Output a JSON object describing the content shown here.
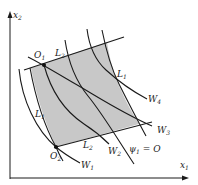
{
  "diagram": {
    "axes": {
      "x_label": "x",
      "x_sub": "1",
      "y_label": "x",
      "y_sub": "2"
    },
    "region_fill": "#c8c8c8",
    "line_color": "#1a1a1a",
    "points": [
      {
        "name": "O",
        "sub": "1"
      },
      {
        "name": "O",
        "sub": "2"
      }
    ],
    "constraints": {
      "L2_top": {
        "label": "L",
        "sub": "2"
      },
      "L2_bottom": {
        "label": "L",
        "sub": "2"
      },
      "L1_left": {
        "label": "L",
        "sub": "1"
      },
      "L1_right": {
        "label": "L",
        "sub": "1"
      }
    },
    "curves": [
      {
        "label": "W",
        "sub": "1"
      },
      {
        "label": "W",
        "sub": "2"
      },
      {
        "label": "W",
        "sub": "3"
      },
      {
        "label": "W",
        "sub": "4"
      },
      {
        "label": "ψ",
        "sub": "1",
        "suffix": " = O"
      }
    ]
  }
}
